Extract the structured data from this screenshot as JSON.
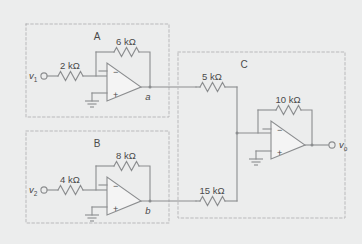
{
  "figure": {
    "caption_partial": ""
  },
  "colors": {
    "background": "#eceded",
    "wire": "#8b8d8f",
    "dashed_box": "#b9b9bb",
    "text": "#4a4a4a",
    "opamp_fill": "#f4f4f4"
  },
  "sections": [
    {
      "id": "A",
      "label": "A"
    },
    {
      "id": "B",
      "label": "B"
    },
    {
      "id": "C",
      "label": "C"
    }
  ],
  "terminals": [
    {
      "id": "v1",
      "label": "v",
      "subscript": "1",
      "kind": "input"
    },
    {
      "id": "v2",
      "label": "v",
      "subscript": "2",
      "kind": "input"
    },
    {
      "id": "vo",
      "label": "v",
      "subscript": "o",
      "kind": "output"
    }
  ],
  "nodes": [
    {
      "id": "a",
      "label": "a"
    },
    {
      "id": "b",
      "label": "b"
    }
  ],
  "resistors": [
    {
      "id": "r-in-a",
      "value": "2 kΩ",
      "section": "A",
      "role": "input"
    },
    {
      "id": "r-fb-a",
      "value": "6 kΩ",
      "section": "A",
      "role": "feedback"
    },
    {
      "id": "r-in-b",
      "value": "4 kΩ",
      "section": "B",
      "role": "input"
    },
    {
      "id": "r-fb-b",
      "value": "8 kΩ",
      "section": "B",
      "role": "feedback"
    },
    {
      "id": "r-sum-a",
      "value": "5 kΩ",
      "section": "C",
      "role": "summing-input"
    },
    {
      "id": "r-sum-b",
      "value": "15 kΩ",
      "section": "C",
      "role": "summing-input"
    },
    {
      "id": "r-fb-c",
      "value": "10 kΩ",
      "section": "C",
      "role": "feedback"
    }
  ],
  "opamps": [
    {
      "id": "opamp-a",
      "section": "A",
      "minus": "−",
      "plus": "+",
      "output_node": "a"
    },
    {
      "id": "opamp-b",
      "section": "B",
      "minus": "−",
      "plus": "+",
      "output_node": "b"
    },
    {
      "id": "opamp-c",
      "section": "C",
      "minus": "−",
      "plus": "+",
      "output_node": "vo"
    }
  ]
}
